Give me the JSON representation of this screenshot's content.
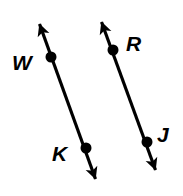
{
  "figure": {
    "background_color": "#ffffff",
    "stroke_color": "#000000",
    "width": 183,
    "height": 196,
    "lines": [
      {
        "name": "line-wk",
        "from_arrow_tip": {
          "x": 38,
          "y": 20
        },
        "to_arrow_tip": {
          "x": 97,
          "y": 183
        },
        "double_headed": true,
        "stroke_width": 3.2,
        "points": [
          "W",
          "K"
        ]
      },
      {
        "name": "line-rj",
        "from_arrow_tip": {
          "x": 100,
          "y": 18
        },
        "to_arrow_tip": {
          "x": 157,
          "y": 174
        },
        "double_headed": true,
        "stroke_width": 3.2,
        "points": [
          "R",
          "J"
        ]
      }
    ],
    "points": [
      {
        "id": "w",
        "label": "W",
        "x": 51,
        "y": 57,
        "radius": 5.5,
        "label_x": 12,
        "label_y": 52,
        "label_size": 21
      },
      {
        "id": "k",
        "label": "K",
        "x": 86,
        "y": 148,
        "radius": 5.5,
        "label_x": 52,
        "label_y": 143,
        "label_size": 21
      },
      {
        "id": "r",
        "label": "R",
        "x": 113,
        "y": 50,
        "radius": 5.5,
        "label_x": 126,
        "label_y": 33,
        "label_size": 21
      },
      {
        "id": "j",
        "label": "J",
        "x": 147,
        "y": 142,
        "radius": 5.5,
        "label_x": 157,
        "label_y": 124,
        "label_size": 21
      }
    ]
  }
}
